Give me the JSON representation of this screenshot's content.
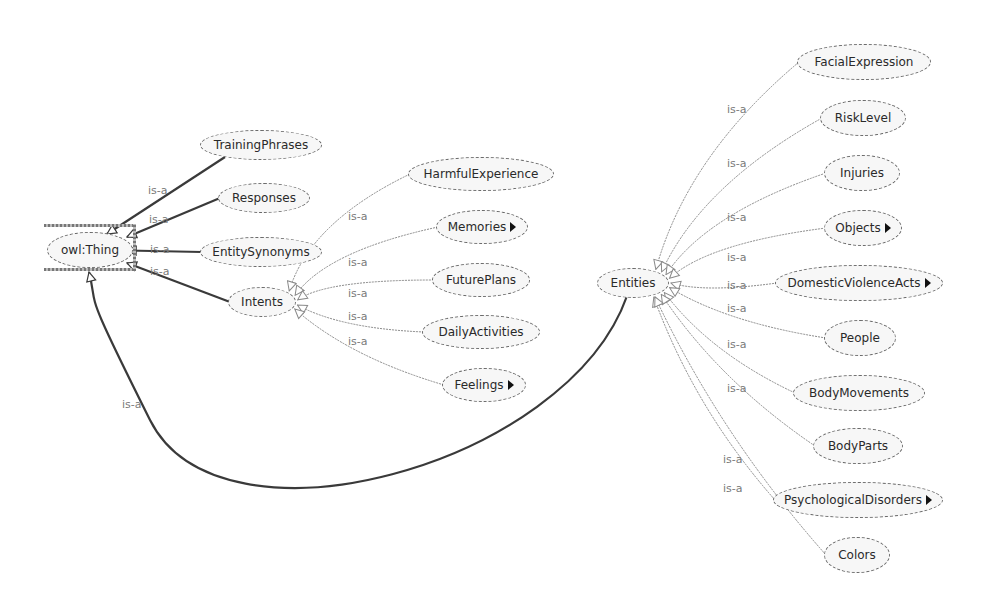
{
  "diagram": {
    "type": "ontology-class-graph",
    "edge_label": "is-a",
    "root": {
      "id": "owl_thing",
      "label": "owl:Thing",
      "x": 47,
      "y": 232,
      "w": 86,
      "h": 36
    },
    "nodes": [
      {
        "id": "training_phrases",
        "label": "TrainingPhrases",
        "x": 200,
        "y": 130,
        "w": 122,
        "h": 30,
        "expandable": false,
        "parent": "owl_thing"
      },
      {
        "id": "responses",
        "label": "Responses",
        "x": 218,
        "y": 183,
        "w": 92,
        "h": 30,
        "expandable": false,
        "parent": "owl_thing"
      },
      {
        "id": "entity_synonyms",
        "label": "EntitySynonyms",
        "x": 200,
        "y": 237,
        "w": 122,
        "h": 30,
        "expandable": false,
        "parent": "owl_thing"
      },
      {
        "id": "intents",
        "label": "Intents",
        "x": 228,
        "y": 287,
        "w": 68,
        "h": 30,
        "expandable": false,
        "parent": "owl_thing"
      },
      {
        "id": "entities",
        "label": "Entities",
        "x": 597,
        "y": 268,
        "w": 72,
        "h": 30,
        "expandable": false,
        "parent": "owl_thing"
      },
      {
        "id": "harmful_experience",
        "label": "HarmfulExperience",
        "x": 408,
        "y": 157,
        "w": 146,
        "h": 34,
        "expandable": false,
        "parent": "intents"
      },
      {
        "id": "memories",
        "label": "Memories",
        "x": 436,
        "y": 210,
        "w": 92,
        "h": 34,
        "expandable": true,
        "parent": "intents"
      },
      {
        "id": "future_plans",
        "label": "FuturePlans",
        "x": 432,
        "y": 263,
        "w": 98,
        "h": 34,
        "expandable": false,
        "parent": "intents"
      },
      {
        "id": "daily_activities",
        "label": "DailyActivities",
        "x": 422,
        "y": 315,
        "w": 118,
        "h": 34,
        "expandable": false,
        "parent": "intents"
      },
      {
        "id": "feelings",
        "label": "Feelings",
        "x": 442,
        "y": 368,
        "w": 84,
        "h": 34,
        "expandable": true,
        "parent": "intents"
      },
      {
        "id": "facial_expression",
        "label": "FacialExpression",
        "x": 797,
        "y": 44,
        "w": 134,
        "h": 36,
        "expandable": false,
        "parent": "entities"
      },
      {
        "id": "risk_level",
        "label": "RiskLevel",
        "x": 820,
        "y": 100,
        "w": 86,
        "h": 36,
        "expandable": false,
        "parent": "entities"
      },
      {
        "id": "injuries",
        "label": "Injuries",
        "x": 824,
        "y": 155,
        "w": 76,
        "h": 36,
        "expandable": false,
        "parent": "entities"
      },
      {
        "id": "objects",
        "label": "Objects",
        "x": 824,
        "y": 210,
        "w": 78,
        "h": 36,
        "expandable": true,
        "parent": "entities"
      },
      {
        "id": "domestic_violence_acts",
        "label": "DomesticViolenceActs",
        "x": 775,
        "y": 265,
        "w": 168,
        "h": 36,
        "expandable": true,
        "parent": "entities"
      },
      {
        "id": "people",
        "label": "People",
        "x": 824,
        "y": 320,
        "w": 72,
        "h": 36,
        "expandable": false,
        "parent": "entities"
      },
      {
        "id": "body_movements",
        "label": "BodyMovements",
        "x": 793,
        "y": 375,
        "w": 132,
        "h": 36,
        "expandable": false,
        "parent": "entities"
      },
      {
        "id": "body_parts",
        "label": "BodyParts",
        "x": 813,
        "y": 428,
        "w": 90,
        "h": 36,
        "expandable": false,
        "parent": "entities"
      },
      {
        "id": "psychological_disorders",
        "label": "PsychologicalDisorders",
        "x": 773,
        "y": 482,
        "w": 170,
        "h": 36,
        "expandable": true,
        "parent": "entities"
      },
      {
        "id": "colors",
        "label": "Colors",
        "x": 824,
        "y": 537,
        "w": 66,
        "h": 36,
        "expandable": false,
        "parent": "entities"
      }
    ],
    "edges": [
      {
        "from": "training_phrases",
        "to": "owl_thing",
        "style": "solid-dark",
        "label": "is-a",
        "lx": 148,
        "ly": 184
      },
      {
        "from": "responses",
        "to": "owl_thing",
        "style": "solid-dark",
        "label": "is-a",
        "lx": 149,
        "ly": 213
      },
      {
        "from": "entity_synonyms",
        "to": "owl_thing",
        "style": "solid-dark",
        "label": "is-a",
        "lx": 150,
        "ly": 243
      },
      {
        "from": "intents",
        "to": "owl_thing",
        "style": "solid-dark",
        "label": "is-a",
        "lx": 150,
        "ly": 265
      },
      {
        "from": "entities",
        "to": "owl_thing",
        "style": "solid-dark",
        "label": "is-a",
        "lx": 122,
        "ly": 398
      },
      {
        "from": "harmful_experience",
        "to": "intents",
        "style": "light",
        "label": "is-a",
        "lx": 348,
        "ly": 210
      },
      {
        "from": "memories",
        "to": "intents",
        "style": "light",
        "label": "is-a",
        "lx": 348,
        "ly": 256
      },
      {
        "from": "future_plans",
        "to": "intents",
        "style": "light",
        "label": "is-a",
        "lx": 348,
        "ly": 287
      },
      {
        "from": "daily_activities",
        "to": "intents",
        "style": "light",
        "label": "is-a",
        "lx": 348,
        "ly": 310
      },
      {
        "from": "feelings",
        "to": "intents",
        "style": "light",
        "label": "is-a",
        "lx": 348,
        "ly": 335
      },
      {
        "from": "facial_expression",
        "to": "entities",
        "style": "light",
        "label": "is-a",
        "lx": 727,
        "ly": 103
      },
      {
        "from": "risk_level",
        "to": "entities",
        "style": "light",
        "label": "is-a",
        "lx": 727,
        "ly": 157
      },
      {
        "from": "injuries",
        "to": "entities",
        "style": "light",
        "label": "is-a",
        "lx": 727,
        "ly": 211
      },
      {
        "from": "objects",
        "to": "entities",
        "style": "light",
        "label": "is-a",
        "lx": 727,
        "ly": 251
      },
      {
        "from": "domestic_violence_acts",
        "to": "entities",
        "style": "light",
        "label": "is-a",
        "lx": 727,
        "ly": 279
      },
      {
        "from": "people",
        "to": "entities",
        "style": "light",
        "label": "is-a",
        "lx": 727,
        "ly": 302
      },
      {
        "from": "body_movements",
        "to": "entities",
        "style": "light",
        "label": "is-a",
        "lx": 727,
        "ly": 338
      },
      {
        "from": "body_parts",
        "to": "entities",
        "style": "light",
        "label": "is-a",
        "lx": 727,
        "ly": 382
      },
      {
        "from": "psychological_disorders",
        "to": "entities",
        "style": "light",
        "label": "is-a",
        "lx": 723,
        "ly": 453
      },
      {
        "from": "colors",
        "to": "entities",
        "style": "light",
        "label": "is-a",
        "lx": 723,
        "ly": 482
      }
    ]
  },
  "colors": {
    "background": "#ffffff",
    "node_fill": "#f7f7f7",
    "node_border": "#6a6a6a",
    "edge_dark": "#3a3a3a",
    "edge_light": "#8a8a8a",
    "edge_label": "#7a7a7a",
    "text": "#2a2a2a"
  }
}
